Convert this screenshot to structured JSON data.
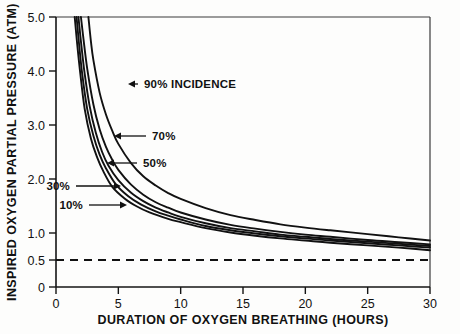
{
  "chart_data": {
    "type": "line",
    "title": "",
    "xlabel": "DURATION OF OXYGEN BREATHING (HOURS)",
    "ylabel": "INSPIRED OXYGEN PARTIAL PRESSURE (ATM)",
    "xlim": [
      0,
      30
    ],
    "ylim": [
      0,
      5.0
    ],
    "xticks": [
      0,
      5,
      10,
      15,
      20,
      25,
      30
    ],
    "xticklabels": [
      "0",
      "5",
      "10",
      "15",
      "20",
      "25",
      "30"
    ],
    "yticks": [
      0,
      0.5,
      1.0,
      2.0,
      3.0,
      4.0,
      5.0
    ],
    "yticklabels": [
      "0",
      "0.5",
      "1.0",
      "2.0",
      "3.0",
      "4.0",
      "5.0"
    ],
    "grid": false,
    "legend_position": "inline-annotations",
    "series": [
      {
        "name": "90% INCIDENCE",
        "label": "90% INCIDENCE",
        "x": [
          2.6,
          2.8,
          3.0,
          3.5,
          4.0,
          4.5,
          5.0,
          6.0,
          7.0,
          8.0,
          9.0,
          10.0,
          12.0,
          14.0,
          16.0,
          18.0,
          20.0,
          22.0,
          25.0,
          27.5,
          30.0
        ],
        "y": [
          5.0,
          4.55,
          4.2,
          3.6,
          3.2,
          2.9,
          2.65,
          2.3,
          2.05,
          1.88,
          1.74,
          1.63,
          1.46,
          1.33,
          1.24,
          1.16,
          1.1,
          1.05,
          0.98,
          0.92,
          0.86
        ]
      },
      {
        "name": "70%",
        "label": "70%",
        "x": [
          2.0,
          2.2,
          2.5,
          3.0,
          3.5,
          4.0,
          4.5,
          5.0,
          6.0,
          7.0,
          8.0,
          9.0,
          10.0,
          12.0,
          14.0,
          16.0,
          18.0,
          20.0,
          22.0,
          25.0,
          27.5,
          30.0
        ],
        "y": [
          5.0,
          4.6,
          4.05,
          3.38,
          2.92,
          2.6,
          2.36,
          2.17,
          1.9,
          1.71,
          1.57,
          1.47,
          1.38,
          1.25,
          1.15,
          1.08,
          1.02,
          0.97,
          0.93,
          0.87,
          0.83,
          0.79
        ]
      },
      {
        "name": "50%",
        "label": "50%",
        "x": [
          1.8,
          2.0,
          2.3,
          2.7,
          3.2,
          3.7,
          4.2,
          5.0,
          6.0,
          7.0,
          8.0,
          9.0,
          10.0,
          12.0,
          14.0,
          16.0,
          18.0,
          20.0,
          22.0,
          25.0,
          27.5,
          30.0
        ],
        "y": [
          5.0,
          4.55,
          3.95,
          3.35,
          2.85,
          2.5,
          2.25,
          1.98,
          1.75,
          1.59,
          1.47,
          1.38,
          1.3,
          1.18,
          1.09,
          1.03,
          0.97,
          0.93,
          0.89,
          0.84,
          0.8,
          0.76
        ]
      },
      {
        "name": "30%",
        "label": "30%",
        "x": [
          1.65,
          1.85,
          2.1,
          2.5,
          3.0,
          3.5,
          4.0,
          4.8,
          5.8,
          6.8,
          8.0,
          9.0,
          10.0,
          12.0,
          14.0,
          16.0,
          18.0,
          20.0,
          22.0,
          25.0,
          27.5,
          30.0
        ],
        "y": [
          5.0,
          4.5,
          3.95,
          3.3,
          2.8,
          2.45,
          2.2,
          1.9,
          1.68,
          1.53,
          1.4,
          1.32,
          1.25,
          1.13,
          1.05,
          0.99,
          0.94,
          0.9,
          0.86,
          0.81,
          0.77,
          0.73
        ]
      },
      {
        "name": "10%",
        "label": "10%",
        "x": [
          1.5,
          1.7,
          1.95,
          2.3,
          2.8,
          3.3,
          3.8,
          4.5,
          5.5,
          6.5,
          7.5,
          9.0,
          10.0,
          12.0,
          14.0,
          16.0,
          18.0,
          20.0,
          22.0,
          25.0,
          27.5,
          30.0
        ],
        "y": [
          5.0,
          4.5,
          3.95,
          3.3,
          2.75,
          2.4,
          2.14,
          1.86,
          1.64,
          1.49,
          1.38,
          1.26,
          1.2,
          1.09,
          1.01,
          0.95,
          0.9,
          0.86,
          0.82,
          0.77,
          0.73,
          0.68
        ]
      }
    ],
    "threshold": {
      "name": "0.5 ATM reference",
      "value": 0.5,
      "style": "dashed"
    },
    "annotations": [
      {
        "text": "90% INCIDENCE",
        "arrow": "left",
        "text_x": 144,
        "text_y": 88,
        "tip_x": 128,
        "tip_y": 84
      },
      {
        "text": "70%",
        "arrow": "left",
        "text_x": 152,
        "text_y": 140,
        "tip_x": 114,
        "tip_y": 136
      },
      {
        "text": "50%",
        "arrow": "left",
        "text_x": 143,
        "text_y": 167,
        "tip_x": 107,
        "tip_y": 163
      },
      {
        "text": "30%",
        "arrow": "right",
        "text_x": 70,
        "text_y": 190,
        "tip_x": 121,
        "tip_y": 186
      },
      {
        "text": "10%",
        "arrow": "right",
        "text_x": 83,
        "text_y": 209,
        "tip_x": 127,
        "tip_y": 205
      }
    ]
  },
  "colors": {
    "curve": "#111111",
    "axis": "#141414",
    "background": "#fdfdfc"
  }
}
